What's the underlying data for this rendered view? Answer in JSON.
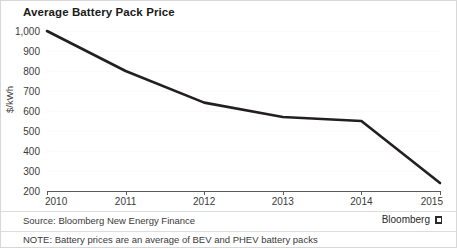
{
  "chart_data": {
    "type": "line",
    "title": "Average Battery Pack Price",
    "xlabel": "",
    "ylabel": "$/kWh",
    "categories": [
      "2010",
      "2011",
      "2012",
      "2013",
      "2014",
      "2015"
    ],
    "x": [
      2010,
      2011,
      2012,
      2013,
      2014,
      2015
    ],
    "values": [
      1000,
      800,
      642,
      570,
      550,
      240
    ],
    "series": [
      {
        "name": "Average battery pack price",
        "values": [
          1000,
          800,
          642,
          570,
          550,
          240
        ],
        "color": "#231f20"
      }
    ],
    "ylim": [
      200,
      1000
    ],
    "y_ticks": [
      200,
      300,
      400,
      500,
      600,
      700,
      800,
      900,
      1000
    ],
    "y_tick_labels": [
      "200",
      "300",
      "400",
      "500",
      "600",
      "700",
      "800",
      "900",
      "1,000"
    ],
    "x_tick_labels": [
      "2010",
      "2011",
      "2012",
      "2013",
      "2014",
      "2015"
    ],
    "grid": true,
    "legend": "none",
    "units": "$/kWh"
  },
  "footer": {
    "source": "Source: Bloomberg New Energy Finance",
    "note": "NOTE: Battery prices are an average of BEV and PHEV battery packs",
    "brand": "Bloomberg",
    "brand_mark": "bloomberg-logo-icon"
  }
}
